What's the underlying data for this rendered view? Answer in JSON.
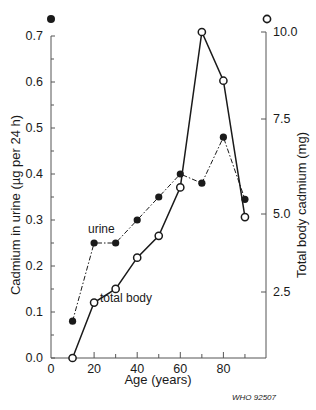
{
  "chart_data": {
    "type": "line",
    "title": "",
    "xlabel": "Age (years)",
    "ylabel": "Cadmium in urine (µg per 24 h)",
    "y2label": "Total body cadmium (mg)",
    "x": [
      10,
      20,
      30,
      40,
      50,
      60,
      70,
      80,
      90
    ],
    "xlim": [
      0,
      95
    ],
    "xticks": [
      "0",
      "20",
      "40",
      "60",
      "80"
    ],
    "ylim": [
      0.0,
      0.7
    ],
    "yticks": [
      "0.0",
      "0.1",
      "0.2",
      "0.3",
      "0.4",
      "0.5",
      "0.6",
      "0.7"
    ],
    "y2lim": [
      0,
      10.0
    ],
    "y2ticks": [
      "2.5",
      "5.0",
      "7.5",
      "10.0"
    ],
    "grid": false,
    "legend_position": "inline labels",
    "left_axis_marker": "filled-circle",
    "right_axis_marker": "open-circle",
    "series": [
      {
        "name": "urine",
        "axis": "left",
        "marker": "filled-circle",
        "line_style": "dash-dot",
        "values": [
          0.08,
          0.25,
          0.25,
          0.3,
          0.35,
          0.4,
          0.38,
          0.48,
          0.345
        ]
      },
      {
        "name": "total body",
        "axis": "right",
        "marker": "open-circle",
        "line_style": "solid",
        "values": [
          0.0,
          2.1,
          2.6,
          3.6,
          4.3,
          5.7,
          10.0,
          8.6,
          4.9
        ]
      }
    ],
    "annotations": [
      "urine",
      "total body"
    ],
    "credit": "WHO 92507"
  },
  "labels": {
    "urine": "urine",
    "total_body": "total body",
    "xlabel": "Age (years)",
    "ylabel": "Cadmium in urine (µg per 24 h)",
    "y2label": "Total body cadmium (mg)",
    "credit": "WHO 92507",
    "xticks": [
      "0",
      "20",
      "40",
      "60",
      "80"
    ],
    "yticks": [
      "0.0",
      "0.1",
      "0.2",
      "0.3",
      "0.4",
      "0.5",
      "0.6",
      "0.7"
    ],
    "y2ticks": [
      "2.5",
      "5.0",
      "7.5",
      "10.0"
    ]
  },
  "colors": {
    "ink": "#1a1a1a",
    "axis": "#555555",
    "background": "#ffffff"
  }
}
